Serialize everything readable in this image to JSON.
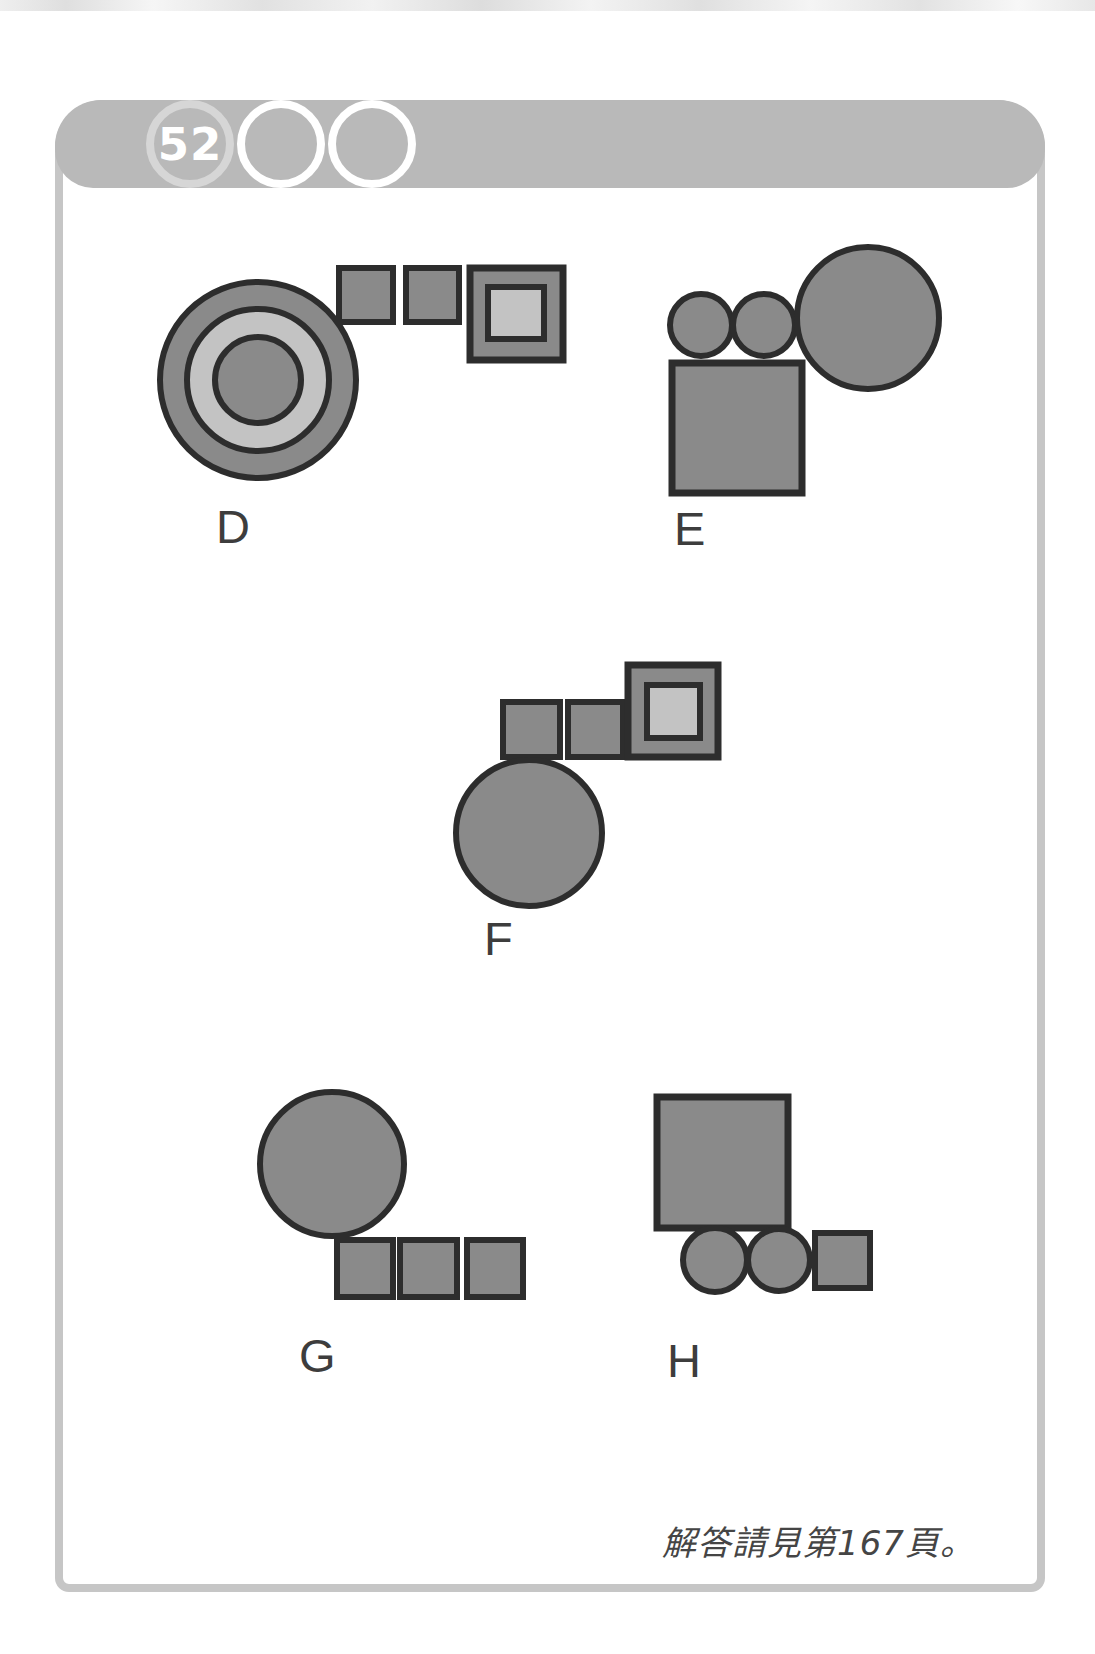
{
  "header": {
    "puzzle_number": "52",
    "bar_color": "#b9b9b9",
    "badge_ring_color": "#d6d6d6",
    "empty_ring_color": "#ffffff",
    "number_color": "#ffffff"
  },
  "card": {
    "border_color": "#c6c6c6"
  },
  "colors": {
    "shape_dark": "#8a8a8a",
    "shape_light": "#c3c3c3",
    "shape_stroke": "#2d2d2d",
    "label_color": "#3d3d3d"
  },
  "figures": {
    "groups": [
      {
        "id": "D",
        "label": "D",
        "label_x": 216,
        "label_y": 543,
        "shapes": [
          {
            "type": "circle",
            "cx": 258,
            "cy": 380,
            "r": 98,
            "fill": "dark",
            "sw": 6
          },
          {
            "type": "circle",
            "cx": 258,
            "cy": 380,
            "r": 71,
            "fill": "light",
            "sw": 6
          },
          {
            "type": "circle",
            "cx": 258,
            "cy": 380,
            "r": 43,
            "fill": "dark",
            "sw": 6
          },
          {
            "type": "rect",
            "x": 339,
            "y": 268,
            "w": 54,
            "h": 54,
            "fill": "dark",
            "sw": 6
          },
          {
            "type": "rect",
            "x": 406,
            "y": 268,
            "w": 53,
            "h": 54,
            "fill": "dark",
            "sw": 6
          },
          {
            "type": "rect",
            "x": 470,
            "y": 268,
            "w": 93,
            "h": 92,
            "fill": "dark",
            "sw": 7
          },
          {
            "type": "rect",
            "x": 488,
            "y": 287,
            "w": 56,
            "h": 52,
            "fill": "light",
            "sw": 6
          }
        ]
      },
      {
        "id": "E",
        "label": "E",
        "label_x": 674,
        "label_y": 545,
        "shapes": [
          {
            "type": "rect",
            "x": 672,
            "y": 363,
            "w": 130,
            "h": 130,
            "fill": "dark",
            "sw": 7
          },
          {
            "type": "circle",
            "cx": 701,
            "cy": 325,
            "r": 31,
            "fill": "dark",
            "sw": 6
          },
          {
            "type": "circle",
            "cx": 764,
            "cy": 325,
            "r": 31,
            "fill": "dark",
            "sw": 6
          },
          {
            "type": "circle",
            "cx": 868,
            "cy": 318,
            "r": 71,
            "fill": "dark",
            "sw": 6
          }
        ]
      },
      {
        "id": "F",
        "label": "F",
        "label_x": 484,
        "label_y": 955,
        "shapes": [
          {
            "type": "rect",
            "x": 503,
            "y": 702,
            "w": 57,
            "h": 55,
            "fill": "dark",
            "sw": 6
          },
          {
            "type": "rect",
            "x": 568,
            "y": 702,
            "w": 55,
            "h": 55,
            "fill": "dark",
            "sw": 6
          },
          {
            "type": "rect",
            "x": 628,
            "y": 665,
            "w": 90,
            "h": 92,
            "fill": "dark",
            "sw": 7
          },
          {
            "type": "rect",
            "x": 647,
            "y": 685,
            "w": 53,
            "h": 53,
            "fill": "light",
            "sw": 6
          },
          {
            "type": "circle",
            "cx": 529,
            "cy": 833,
            "r": 73,
            "fill": "dark",
            "sw": 6
          }
        ]
      },
      {
        "id": "G",
        "label": "G",
        "label_x": 299,
        "label_y": 1372,
        "shapes": [
          {
            "type": "circle",
            "cx": 332,
            "cy": 1164,
            "r": 72,
            "fill": "dark",
            "sw": 6
          },
          {
            "type": "rect",
            "x": 337,
            "y": 1240,
            "w": 56,
            "h": 57,
            "fill": "dark",
            "sw": 6
          },
          {
            "type": "rect",
            "x": 400,
            "y": 1240,
            "w": 57,
            "h": 57,
            "fill": "dark",
            "sw": 6
          },
          {
            "type": "rect",
            "x": 467,
            "y": 1240,
            "w": 56,
            "h": 57,
            "fill": "dark",
            "sw": 6
          }
        ]
      },
      {
        "id": "H",
        "label": "H",
        "label_x": 667,
        "label_y": 1377,
        "shapes": [
          {
            "type": "rect",
            "x": 657,
            "y": 1097,
            "w": 131,
            "h": 131,
            "fill": "dark",
            "sw": 7
          },
          {
            "type": "circle",
            "cx": 715,
            "cy": 1260,
            "r": 32,
            "fill": "dark",
            "sw": 6
          },
          {
            "type": "circle",
            "cx": 779,
            "cy": 1260,
            "r": 31,
            "fill": "dark",
            "sw": 6
          },
          {
            "type": "rect",
            "x": 815,
            "y": 1233,
            "w": 55,
            "h": 55,
            "fill": "dark",
            "sw": 6
          }
        ]
      }
    ]
  },
  "footer": {
    "note": "解答請見第167頁。"
  }
}
